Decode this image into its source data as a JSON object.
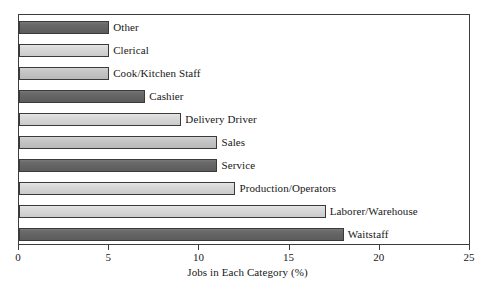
{
  "chart_data": {
    "type": "bar",
    "orientation": "horizontal",
    "title": "",
    "xlabel": "Jobs in Each Category (%)",
    "ylabel": "",
    "xlim": [
      0,
      25
    ],
    "xticks": [
      0,
      5,
      10,
      15,
      20,
      25
    ],
    "xtick_labels": [
      "0",
      "5",
      "10",
      "15",
      "20",
      "25"
    ],
    "grid": false,
    "legend": false,
    "categories": [
      "Other",
      "Clerical",
      "Cook/Kitchen Staff",
      "Cashier",
      "Delivery Driver",
      "Sales",
      "Service",
      "Production/Operators",
      "Laborer/Warehouse",
      "Waitstaff"
    ],
    "values": [
      5,
      5,
      5,
      7,
      9,
      11,
      11,
      12,
      17,
      18
    ],
    "bar_shades": [
      "dark",
      "light",
      "mid",
      "dark",
      "light",
      "mid",
      "dark",
      "light",
      "light",
      "dark"
    ],
    "colors": {
      "dark": "#646464",
      "light": "#d6d6d6",
      "mid": "#c4c4c4",
      "bar_outline": "#3a3a3a",
      "frame": "#3c3c3c",
      "text": "#171717",
      "background": "#ffffff"
    }
  },
  "axis": {
    "title": "Jobs in Each Category (%)"
  }
}
